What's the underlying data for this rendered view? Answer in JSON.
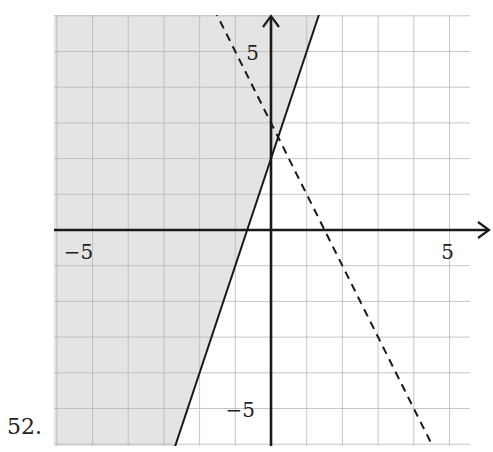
{
  "problem": {
    "number_label": "52."
  },
  "chart_data": {
    "type": "line",
    "title": "",
    "xlabel": "",
    "ylabel": "",
    "xlim": [
      -6,
      6
    ],
    "ylim": [
      -6,
      6
    ],
    "grid": true,
    "grid_step": 1,
    "tick_labels": {
      "x": [
        {
          "value": -5,
          "label": "−5"
        },
        {
          "value": 5,
          "label": "5"
        }
      ],
      "y": [
        {
          "value": 5,
          "label": "5"
        },
        {
          "value": -5,
          "label": "−5"
        }
      ]
    },
    "series": [
      {
        "name": "boundary-solid",
        "style": "solid",
        "equation": "y = 3x + 2",
        "slope": 3,
        "intercept": 2,
        "color": "#1a1a1a"
      },
      {
        "name": "boundary-dashed",
        "style": "dashed",
        "equation": "y = -2x + 3",
        "slope": -2,
        "intercept": 3,
        "color": "#1a1a1a"
      }
    ],
    "shaded_region": {
      "description": "y > 3x + 2 (left of solid line)",
      "color": "#e4e4e4"
    }
  },
  "colors": {
    "axis": "#1a1a1a",
    "grid": "#b8b8b8",
    "shade": "#e4e4e4",
    "background": "#ffffff"
  }
}
